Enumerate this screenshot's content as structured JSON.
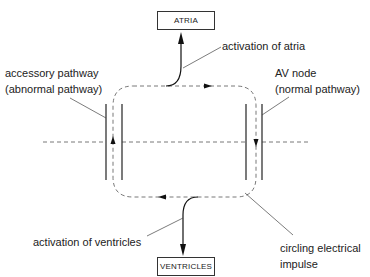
{
  "diagram": {
    "type": "reentry-circuit",
    "boxes": {
      "atria": "ATRIA",
      "ventricles": "VENTRICLES"
    },
    "labels": {
      "activation_atria": "activation of atria",
      "accessory_line1": "accessory pathway",
      "accessory_line2": "(abnormal pathway)",
      "av_node_line1": "AV node",
      "av_node_line2": "(normal pathway)",
      "activation_ventricles": "activation of ventricles",
      "circling_line1": "circling electrical",
      "circling_line2": "impulse"
    },
    "colors": {
      "line": "#333333",
      "dashed": "#555555",
      "text": "#222222"
    }
  }
}
